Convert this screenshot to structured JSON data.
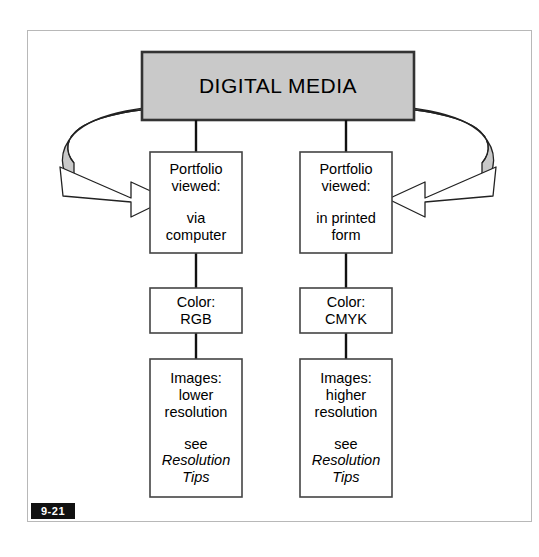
{
  "figure": {
    "number": "9-21",
    "header": {
      "label": "DIGITAL MEDIA"
    },
    "colors": {
      "header_fill": "#c9c9c9",
      "header_border": "#333333",
      "ribbon_fill": "#c9c9c9",
      "ribbon_stroke": "#222222",
      "arrowhead_fill": "#ffffff",
      "arrowhead_stroke": "#222222",
      "box_fill": "#ffffff",
      "box_border": "#444444",
      "frame_border": "#b8b8b8",
      "connector": "#111111",
      "badge_bg": "#111111",
      "badge_text": "#ffffff"
    },
    "columns": [
      {
        "id": "left",
        "boxes": [
          {
            "id": "portfolio-viewed-computer",
            "line1": "Portfolio",
            "line2": "viewed:",
            "line3": "via",
            "line4": "computer"
          },
          {
            "id": "color-rgb",
            "line1": "Color:",
            "line2": "RGB"
          },
          {
            "id": "images-lower-resolution",
            "line1": "Images:",
            "line2": "lower",
            "line3": "resolution",
            "line4": "see",
            "line5": "Resolution",
            "line6": "Tips"
          }
        ]
      },
      {
        "id": "right",
        "boxes": [
          {
            "id": "portfolio-viewed-print",
            "line1": "Portfolio",
            "line2": "viewed:",
            "line3": "in printed",
            "line4": "form"
          },
          {
            "id": "color-cmyk",
            "line1": "Color:",
            "line2": "CMYK"
          },
          {
            "id": "images-higher-resolution",
            "line1": "Images:",
            "line2": "higher",
            "line3": "resolution",
            "line4": "see",
            "line5": "Resolution",
            "line6": "Tips"
          }
        ]
      }
    ],
    "arrows": [
      {
        "id": "ribbon-arrow-left",
        "direction": "right",
        "points_to": "portfolio-viewed-computer"
      },
      {
        "id": "ribbon-arrow-right",
        "direction": "left",
        "points_to": "portfolio-viewed-print"
      }
    ]
  }
}
